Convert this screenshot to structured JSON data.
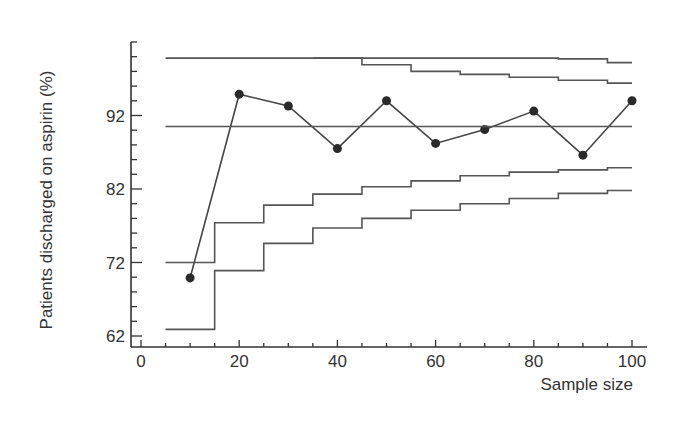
{
  "chart_data": {
    "type": "line",
    "title": "",
    "xlabel": "Sample size",
    "ylabel": "Patients discharged on aspirin (%)",
    "xlim": [
      0,
      100
    ],
    "ylim": [
      62,
      102
    ],
    "x_ticks": [
      0,
      20,
      40,
      60,
      80,
      100
    ],
    "x_tick_labels": [
      "0",
      "20",
      "40",
      "60",
      "80",
      "100"
    ],
    "y_ticks": [
      62,
      72,
      82,
      92
    ],
    "y_tick_labels": [
      "62",
      "72",
      "82",
      "92"
    ],
    "grid": false,
    "legend": null,
    "series": [
      {
        "name": "Observed proportion",
        "style": "line-with-markers",
        "x": [
          10,
          20,
          30,
          40,
          50,
          60,
          70,
          80,
          90,
          100
        ],
        "values": [
          69.9,
          94.9,
          93.3,
          87.5,
          94.0,
          88.2,
          90.1,
          92.6,
          86.6,
          94.0
        ]
      },
      {
        "name": "Centre line (mean)",
        "style": "horizontal-line",
        "x": [
          5,
          100
        ],
        "values": [
          90.5,
          90.5
        ]
      },
      {
        "name": "Upper outer limit",
        "style": "step",
        "x": [
          5,
          35,
          45,
          55,
          65,
          75,
          85,
          95,
          100
        ],
        "values": [
          99.8,
          99.8,
          99.8,
          99.8,
          99.8,
          99.8,
          99.7,
          99.2,
          99.2
        ]
      },
      {
        "name": "Upper inner limit",
        "style": "step",
        "x": [
          35,
          45,
          55,
          65,
          75,
          85,
          95,
          100
        ],
        "values": [
          99.8,
          98.9,
          98.0,
          97.6,
          97.2,
          96.8,
          96.4,
          96.4
        ]
      },
      {
        "name": "Lower inner limit",
        "style": "step",
        "x": [
          5,
          15,
          25,
          35,
          45,
          55,
          65,
          75,
          85,
          95,
          100
        ],
        "values": [
          72.0,
          77.4,
          79.8,
          81.3,
          82.3,
          83.1,
          83.8,
          84.3,
          84.6,
          84.9,
          84.9
        ]
      },
      {
        "name": "Lower outer limit",
        "style": "step",
        "x": [
          5,
          15,
          25,
          35,
          45,
          55,
          65,
          75,
          85,
          95,
          100
        ],
        "values": [
          62.9,
          70.9,
          74.6,
          76.7,
          78.0,
          79.1,
          80.0,
          80.7,
          81.4,
          81.8,
          81.8
        ]
      }
    ]
  }
}
